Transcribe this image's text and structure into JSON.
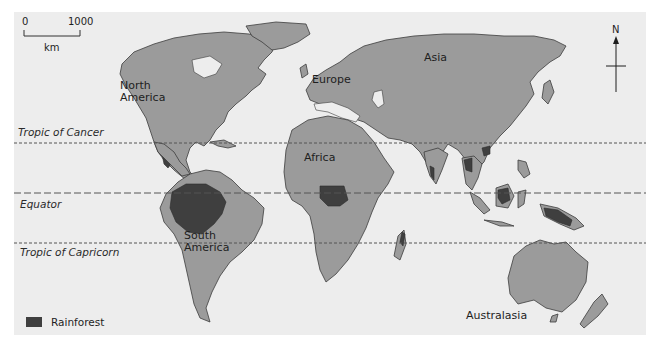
{
  "map": {
    "type": "world-rainforest-distribution",
    "colors": {
      "background": "#ededed",
      "land": "#9b9b9b",
      "rainforest": "#3f3f3f",
      "coastline": "#3c3c3c",
      "latitude_lines": "#555555"
    },
    "scale": {
      "start": "0",
      "end": "1000",
      "unit": "km"
    },
    "north_arrow": {
      "label": "N"
    },
    "latitude_lines": [
      {
        "name": "Tropic of Cancer",
        "style": "dotted"
      },
      {
        "name": "Equator",
        "style": "dashed"
      },
      {
        "name": "Tropic of Capricorn",
        "style": "dotted"
      }
    ],
    "continents": [
      {
        "name": "North America",
        "line1": "North",
        "line2": "America"
      },
      {
        "name": "South America",
        "line1": "South",
        "line2": "America"
      },
      {
        "name": "Europe",
        "line1": "Europe"
      },
      {
        "name": "Asia",
        "line1": "Asia"
      },
      {
        "name": "Africa",
        "line1": "Africa"
      },
      {
        "name": "Australasia",
        "line1": "Australasia"
      }
    ],
    "legend": [
      {
        "label": "Rainforest",
        "color": "#3f3f3f"
      }
    ]
  }
}
